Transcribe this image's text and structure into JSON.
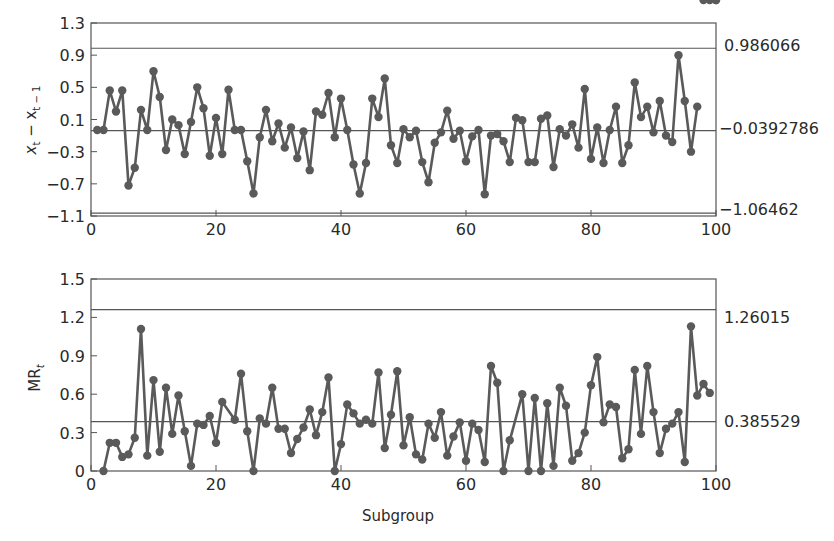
{
  "chart_data": [
    {
      "type": "line",
      "title": "",
      "xlabel": "",
      "ylabel": "x_t − x_{t−1}",
      "xlim": [
        0,
        100
      ],
      "ylim": [
        -1.1,
        1.3
      ],
      "x_ticks": [
        "0",
        "20",
        "40",
        "60",
        "80",
        "100"
      ],
      "y_ticks": [
        "1.3",
        "0.9",
        "0.5",
        "0.1",
        "-0.3",
        "-0.7",
        "-1.1"
      ],
      "grid": false,
      "control_lines": [
        {
          "name": "UCL",
          "value": 0.986066,
          "label": "0.986066"
        },
        {
          "name": "CL",
          "value": -0.0392786,
          "label": "−0.0392786"
        },
        {
          "name": "LCL",
          "value": -1.06462,
          "label": "−1.06462"
        }
      ],
      "series": [
        {
          "name": "x_t - x_{t-1}",
          "x": [
            1,
            2,
            3,
            4,
            5,
            6,
            7,
            8,
            9,
            10,
            11,
            12,
            13,
            14,
            15,
            16,
            17,
            18,
            19,
            20,
            21,
            22,
            23,
            24,
            25,
            26,
            27,
            28,
            29,
            30,
            31,
            32,
            33,
            34,
            35,
            36,
            37,
            38,
            39,
            40,
            41,
            42,
            43,
            44,
            45,
            46,
            47,
            48,
            49,
            50,
            51,
            52,
            53,
            54,
            55,
            56,
            57,
            58,
            59,
            60,
            61,
            62,
            63,
            64,
            65,
            66,
            67,
            68,
            69,
            70,
            71,
            72,
            73,
            74,
            75,
            76,
            77,
            78,
            79,
            80,
            81,
            82,
            83,
            84,
            85,
            86,
            87,
            88,
            89,
            90,
            91,
            92,
            93,
            94,
            95,
            96,
            97,
            98,
            99,
            100
          ],
          "values": [
            -0.03,
            -0.03,
            0.46,
            0.2,
            0.46,
            -0.72,
            -0.5,
            0.22,
            -0.03,
            0.7,
            0.38,
            -0.28,
            0.1,
            0.03,
            -0.33,
            0.07,
            0.5,
            0.24,
            -0.35,
            0.12,
            -0.33,
            0.47,
            -0.03,
            -0.03,
            -0.42,
            -0.82,
            -0.12,
            0.22,
            -0.17,
            0.05,
            -0.25,
            -0.0,
            -0.38,
            -0.05,
            -0.53,
            0.2,
            0.16,
            0.43,
            -0.12,
            0.36,
            -0.03,
            -0.46,
            -0.82,
            -0.44,
            0.36,
            0.13,
            0.61,
            -0.22,
            -0.44,
            -0.02,
            -0.12,
            -0.04,
            -0.43,
            -0.68,
            -0.19,
            -0.06,
            0.21,
            -0.14,
            -0.04,
            -0.42,
            -0.11,
            -0.03,
            -0.83,
            -0.1,
            -0.08,
            -0.17,
            -0.43,
            0.12,
            0.09,
            -0.43,
            -0.43,
            0.11,
            0.15,
            -0.49,
            -0.02,
            -0.1,
            0.04,
            -0.25,
            0.48,
            -0.39,
            0.0,
            -0.44,
            -0.03,
            0.26,
            -0.44,
            -0.22,
            0.56,
            0.13,
            0.26,
            -0.06,
            0.33,
            -0.1,
            -0.18,
            0.9,
            0.33,
            -0.3,
            0.26
          ]
        }
      ]
    },
    {
      "type": "line",
      "title": "",
      "xlabel": "Subgroup",
      "ylabel": "MR_t",
      "xlim": [
        0,
        100
      ],
      "ylim": [
        0,
        1.5
      ],
      "x_ticks": [
        "0",
        "20",
        "40",
        "60",
        "80",
        "100"
      ],
      "y_ticks": [
        "1.5",
        "1.2",
        "0.9",
        "0.6",
        "0.3",
        "0"
      ],
      "grid": false,
      "control_lines": [
        {
          "name": "UCL",
          "value": 1.26015,
          "label": "1.26015"
        },
        {
          "name": "CL",
          "value": 0.385529,
          "label": "0.385529"
        },
        {
          "name": "LCL",
          "value": 0,
          "label": ""
        }
      ],
      "series": [
        {
          "name": "MR_t",
          "x": [
            2,
            3,
            4,
            5,
            6,
            7,
            8,
            9,
            10,
            11,
            12,
            13,
            14,
            15,
            16,
            17,
            18,
            19,
            20,
            21,
            23,
            24,
            25,
            26,
            27,
            28,
            29,
            30,
            31,
            32,
            33,
            34,
            35,
            36,
            37,
            38,
            39,
            40,
            41,
            42,
            43,
            44,
            45,
            46,
            47,
            48,
            49,
            50,
            51,
            52,
            53,
            54,
            55,
            56,
            57,
            58,
            59,
            60,
            61,
            62,
            63,
            64,
            65,
            66,
            67,
            69,
            70,
            71,
            72,
            73,
            74,
            75,
            76,
            77,
            78,
            79,
            80,
            81,
            82,
            83,
            84,
            85,
            86,
            87,
            88,
            89,
            90,
            91,
            92,
            93,
            94,
            95,
            96,
            97,
            98,
            99,
            100
          ],
          "values": [
            0.0,
            0.22,
            0.22,
            0.11,
            0.13,
            0.26,
            1.11,
            0.12,
            0.71,
            0.15,
            0.65,
            0.29,
            0.59,
            0.31,
            0.04,
            0.37,
            0.36,
            0.43,
            0.22,
            0.54,
            0.4,
            0.76,
            0.31,
            0.0,
            0.41,
            0.37,
            0.65,
            0.33,
            0.33,
            0.14,
            0.25,
            0.34,
            0.48,
            0.28,
            0.46,
            0.73,
            0.0,
            0.21,
            0.52,
            0.45,
            0.37,
            0.4,
            0.37,
            0.77,
            0.18,
            0.44,
            0.78,
            0.2,
            0.42,
            0.13,
            0.09,
            0.37,
            0.26,
            0.46,
            0.12,
            0.27,
            0.38,
            0.08,
            0.37,
            0.32,
            0.07,
            0.82,
            0.69,
            0.0,
            0.24,
            0.6,
            0.0,
            0.57,
            0.0,
            0.53,
            0.04,
            0.65,
            0.51,
            0.08,
            0.14,
            0.3,
            0.67,
            0.89,
            0.38,
            0.52,
            0.5,
            0.1,
            0.17,
            0.79,
            0.29,
            0.82,
            0.46,
            0.14,
            0.33,
            0.37,
            0.46,
            0.07,
            1.13,
            0.59,
            0.68,
            0.61
          ]
        }
      ]
    }
  ],
  "top_plot": {
    "ylabel": "x",
    "ylabel_sub1": "t",
    "ylabel_mid": " − x",
    "ylabel_sub2": "t − 1",
    "ucl_label": "0.986066",
    "cl_label": "−0.0392786",
    "lcl_label": "−1.06462"
  },
  "bottom_plot": {
    "ylabel": "MR",
    "ylabel_sub": "t",
    "ucl_label": "1.26015",
    "cl_label": "0.385529",
    "xlabel": "Subgroup"
  },
  "colors": {
    "line": "#5a5a5a",
    "marker": "#5a5a5a",
    "frame": "#555555",
    "text": "#2a2a2a"
  }
}
